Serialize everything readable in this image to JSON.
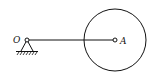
{
  "diagram": {
    "type": "mechanism",
    "labels": {
      "pivot": "O",
      "center": "A"
    },
    "elements": [
      {
        "name": "pin-support",
        "at": "O"
      },
      {
        "name": "rod",
        "from": "O",
        "to": "A"
      },
      {
        "name": "disk",
        "center": "A"
      }
    ],
    "colors": {
      "stroke": "#111111",
      "background": "#ffffff"
    }
  }
}
